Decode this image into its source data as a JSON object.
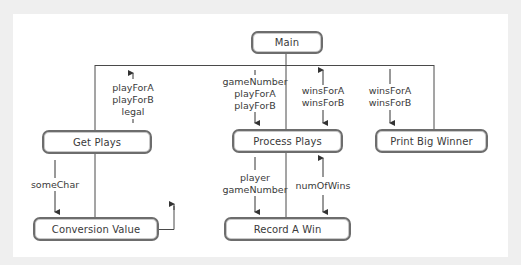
{
  "diagram": {
    "type": "structure-chart",
    "modules": {
      "main": "Main",
      "get_plays": "Get Plays",
      "process_plays": "Process Plays",
      "print_big_winner": "Print Big Winner",
      "conversion_value": "Conversion Value",
      "record_a_win": "Record A Win"
    },
    "flows": {
      "get_plays_out": [
        "playForA",
        "playForB",
        "legal"
      ],
      "process_plays_in": [
        "gameNumber",
        "playForA",
        "playForB"
      ],
      "process_plays_inout": [
        "winsForA",
        "winsForB"
      ],
      "print_big_winner_in": [
        "winsForA",
        "winsForB"
      ],
      "conversion_value_in": [
        "someChar"
      ],
      "record_a_win_in": [
        "player",
        "gameNumber"
      ],
      "record_a_win_inout": [
        "numOfWins"
      ]
    },
    "colors": {
      "background": "#efefef",
      "panel": "#ffffff",
      "line": "#4a4a4a",
      "box_border": "#6d6d6d",
      "text": "#3a3a3a"
    }
  }
}
